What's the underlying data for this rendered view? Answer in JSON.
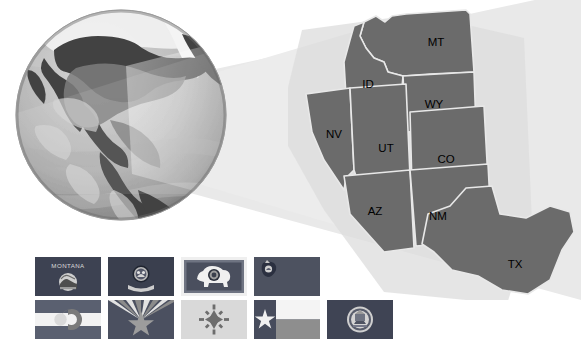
{
  "figure": {
    "background_color": "#ffffff"
  },
  "globe": {
    "name": "earth-globe",
    "description": "Grayscale satellite globe centered on North America",
    "ocean_color": "#b9b9b9",
    "land_color": "#4a4a4a",
    "ice_color": "#f2f2f2",
    "shadow_color": "#8f8f8f",
    "center_x": 107,
    "center_y": 111,
    "radius": 105
  },
  "projection_cone": {
    "name": "projection-cone",
    "fill_color": "#e9e9e9",
    "description": "Light wedge projecting from the globe toward the inset map"
  },
  "map": {
    "name": "western-states-map",
    "state_fill": "#6b6b6b",
    "state_border": "#e6e6e6",
    "shadow_fill": "#dcdcdc",
    "label_color": "#000000",
    "states": [
      {
        "code": "MT",
        "name": "Montana",
        "label_x": 148,
        "label_y": 43
      },
      {
        "code": "ID",
        "name": "Idaho",
        "label_x": 80,
        "label_y": 85
      },
      {
        "code": "WY",
        "name": "Wyoming",
        "label_x": 146,
        "label_y": 105
      },
      {
        "code": "NV",
        "name": "Nevada",
        "label_x": 46,
        "label_y": 135
      },
      {
        "code": "UT",
        "name": "Utah",
        "label_x": 98,
        "label_y": 149
      },
      {
        "code": "CO",
        "name": "Colorado",
        "label_x": 156,
        "label_y": 160
      },
      {
        "code": "AZ",
        "name": "Arizona",
        "label_x": 87,
        "label_y": 212
      },
      {
        "code": "NM",
        "name": "New Mexico",
        "label_x": 148,
        "label_y": 217
      },
      {
        "code": "TX",
        "name": "Texas",
        "label_x": 227,
        "label_y": 265
      }
    ]
  },
  "flags": {
    "name": "state-flags-strip",
    "row1": [
      {
        "code": "MT",
        "state": "Montana",
        "caption": "MONTANA",
        "field_color": "#3d4252",
        "emblem": "state-seal",
        "has_text_band": true
      },
      {
        "code": "ID",
        "state": "Idaho",
        "caption": "",
        "field_color": "#3a3f4e",
        "emblem": "state-seal-with-banner",
        "has_text_band": false
      },
      {
        "code": "WY",
        "state": "Wyoming",
        "caption": "",
        "field_color": "#4a4f5e",
        "emblem": "bison-silhouette",
        "has_text_band": false,
        "border_color": "#efefef"
      },
      {
        "code": "NV",
        "state": "Nevada",
        "caption": "",
        "field_color": "#4d5260",
        "emblem": "canton-emblem",
        "has_text_band": false
      }
    ],
    "row2": [
      {
        "code": "CO",
        "state": "Colorado",
        "caption": "",
        "field_color": "#5a6070",
        "emblem": "letter-c",
        "stripe_color": "#f2f2f2"
      },
      {
        "code": "AZ",
        "state": "Arizona",
        "caption": "",
        "field_color": "#4b5060",
        "emblem": "rays-and-star",
        "ray_light": "#e2e2e2",
        "ray_dark": "#8b8b8b"
      },
      {
        "code": "NM",
        "state": "New Mexico",
        "caption": "",
        "field_color": "#d9d9d9",
        "emblem": "zia-sun-symbol"
      },
      {
        "code": "TX",
        "state": "Texas",
        "caption": "",
        "field_color": "#474c5c",
        "emblem": "lone-star",
        "stripe_white": "#f4f4f4",
        "stripe_dark": "#8e8e8e"
      },
      {
        "code": "UT",
        "state": "Utah",
        "caption": "",
        "field_color": "#3f4454",
        "emblem": "state-seal"
      }
    ]
  }
}
